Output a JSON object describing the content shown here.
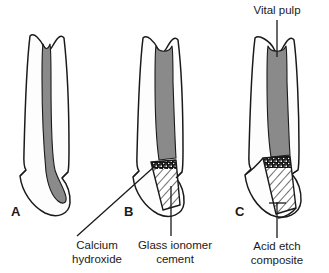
{
  "figure": {
    "background_color": "#ffffff",
    "outline_color": "#1a1a1a",
    "pulp_color": "#8a8a8a",
    "dentin_color": "#fdfdfd",
    "calcium_hydroxide_color": "#111111",
    "text_color": "#1a1a1a"
  },
  "panels": [
    {
      "key": "A",
      "caption": "A",
      "description": "Tooth with deep carious lesion approaching the vital pulp; pulp chamber and root canal shaded grey, no restoration placed."
    },
    {
      "key": "B",
      "caption": "B",
      "description": "Cavity lined with calcium hydroxide over the pulpal floor and restored with a glass ionomer cement base."
    },
    {
      "key": "C",
      "caption": "C",
      "description": "Definitive restoration: calcium hydroxide liner, glass ionomer cement base and acid etch composite restoring the crown contour."
    }
  ],
  "annotations": [
    {
      "id": "vital-pulp",
      "lines": [
        "Vital pulp"
      ],
      "text": "Vital pulp",
      "target_panel": "C",
      "leader": "vertical-down"
    },
    {
      "id": "calcium-hydroxide",
      "lines": [
        "Calcium",
        "hydroxide"
      ],
      "text": "Calcium hydroxide",
      "target_panel": "B",
      "leader": "diagonal-up-right"
    },
    {
      "id": "glass-ionomer-cement",
      "lines": [
        "Glass ionomer",
        "cement"
      ],
      "text": "Glass ionomer cement",
      "target_panel": "B",
      "leader": "vertical-up"
    },
    {
      "id": "acid-etch-composite",
      "lines": [
        "Acid etch",
        "composite"
      ],
      "text": "Acid etch composite",
      "target_panel": "C",
      "leader": "vertical-up"
    }
  ],
  "materials": [
    {
      "name": "Vital pulp",
      "fill": "solid-grey"
    },
    {
      "name": "Calcium hydroxide",
      "fill": "stipple-black"
    },
    {
      "name": "Glass ionomer cement",
      "fill": "diagonal-hatch"
    },
    {
      "name": "Acid etch composite",
      "fill": "white-outline"
    }
  ]
}
